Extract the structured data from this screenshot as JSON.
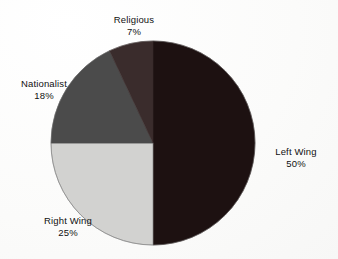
{
  "chart_data": {
    "type": "pie",
    "title": "",
    "subtitle": "",
    "xlabel": "",
    "ylabel": "",
    "legend_position": "none",
    "grid": false,
    "labels_outside": true,
    "value_suffix": "%",
    "categories": [
      "Left Wing",
      "Right Wing",
      "Nationalist",
      "Religious"
    ],
    "values": [
      50,
      25,
      18,
      7
    ],
    "slices": [
      {
        "name": "Left Wing",
        "value": 50,
        "value_text": "50%",
        "color": "#1d1111",
        "start_angle": 0,
        "end_angle": 180,
        "label_position": "right"
      },
      {
        "name": "Right Wing",
        "value": 25,
        "value_text": "25%",
        "color": "#d2d2d0",
        "start_angle": 180,
        "end_angle": 270,
        "label_position": "bottom-left"
      },
      {
        "name": "Nationalist",
        "value": 18,
        "value_text": "18%",
        "color": "#4b4b4b",
        "start_angle": 270,
        "end_angle": 334.8,
        "label_position": "left"
      },
      {
        "name": "Religious",
        "value": 7,
        "value_text": "7%",
        "color": "#3a2c2c",
        "start_angle": 334.8,
        "end_angle": 360,
        "label_position": "top"
      }
    ]
  },
  "labels": {
    "left_wing": {
      "name": "Left Wing",
      "value": "50%"
    },
    "right_wing": {
      "name": "Right Wing",
      "value": "25%"
    },
    "nationalist": {
      "name": "Nationalist",
      "value": "18%"
    },
    "religious": {
      "name": "Religious",
      "value": "7%"
    }
  },
  "geometry": {
    "center_x": 153,
    "center_y": 143,
    "radius": 102
  },
  "colors": {
    "background": "#fdfdfd",
    "text": "#111111",
    "outline": "#8d8d8d",
    "left_wing": "#1d1111",
    "right_wing": "#d2d2d0",
    "nationalist": "#4b4b4b",
    "religious": "#3a2c2c"
  }
}
